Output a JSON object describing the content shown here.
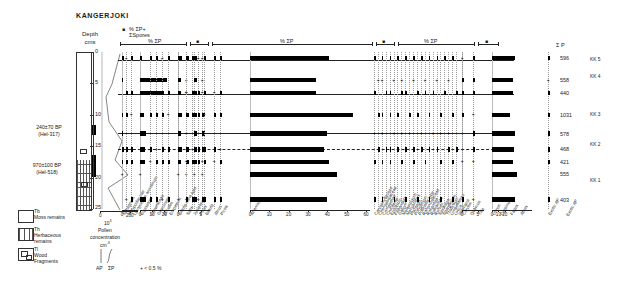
{
  "title": "KANGERJOKI",
  "header": {
    "spores_axis_label": "% ΣP+ ΣSpores",
    "sum_axis_label": "% ΣP",
    "depth_label_line1": "Depth",
    "depth_label_line2": "cms"
  },
  "dates": [
    {
      "value": "240±70 BP",
      "lab": "(Hel-317)"
    },
    {
      "value": "970±100 BP",
      "lab": "(Hel-518)"
    }
  ],
  "depth_axis": {
    "unit": "cms",
    "ticks": [
      0,
      5,
      10,
      15,
      20,
      25
    ],
    "min": 0,
    "max": 25
  },
  "concentration": {
    "title_line1": "Pollen",
    "title_line2": "concentration",
    "title_line3": "cm",
    "exponent": "-3",
    "multiplier": "10",
    "multiplier_exp": "3",
    "ticks": [
      0,
      200
    ],
    "ap_label": "AP",
    "sp_label": "ΣP",
    "values": [
      120,
      95,
      60,
      75,
      140,
      105,
      175,
      60,
      120
    ]
  },
  "footnote": "+ < 0.5 %",
  "legend": [
    {
      "code": "Tb",
      "name_line1": "Moss remains",
      "name_line2": ""
    },
    {
      "code": "Th",
      "name_line1": "Herbaceous",
      "name_line2": "remains"
    },
    {
      "code": "Tl",
      "name_line1": "Wood",
      "name_line2": "Fragments"
    }
  ],
  "sum_column": {
    "header": "Σ P",
    "values": [
      596,
      558,
      440,
      1031,
      578,
      468,
      421,
      555,
      403
    ]
  },
  "zones": [
    "KK 5",
    "KK 4",
    "KK 3",
    "KK 2",
    "KK 1"
  ],
  "exotic_label": "Exotic AP",
  "sample_depths": [
    1,
    4.5,
    6.5,
    10,
    13,
    15.5,
    17.5,
    19.5,
    23.5
  ],
  "chart_data": {
    "type": "bar",
    "orientation": "horizontal-stacked-columns",
    "xlabel": "% ΣP",
    "ylabel": "Depth (cms)",
    "y": [
      1,
      4.5,
      6.5,
      10,
      13,
      15.5,
      17.5,
      19.5,
      23.5
    ],
    "panels": [
      {
        "name": "panel-1",
        "axis_label": "% ΣP+ ΣSpores",
        "ticks": [
          0
        ],
        "xmax": 20,
        "taxa": [
          {
            "name": "Sphagnum",
            "values": [
              2,
              1,
              0,
              1.5,
              1,
              2,
              1,
              0.3,
              0
            ]
          }
        ]
      },
      {
        "name": "panel-2",
        "axis_label": "% ΣP",
        "ticks": [
          0,
          10,
          20
        ],
        "xmax": 28,
        "taxa": [
          {
            "name": "Cyperaceae",
            "values": [
              2,
              22,
              18,
              3.5,
              5,
              4,
              4,
              0.3,
              5
            ]
          }
        ]
      },
      {
        "name": "panel-3",
        "axis_label": "% ΣP",
        "ticks": [
          0,
          5
        ],
        "xmax": 7,
        "taxa": [
          {
            "name": "Gramineae",
            "values": [
              1.5,
              1.2,
              1.2,
              1.4,
              1.2,
              1.5,
              1.3,
              0.4,
              0.4
            ]
          },
          {
            "name": "Ericales",
            "values": [
              1.2,
              0.4,
              0.4,
              1.2,
              0.4,
              1.3,
              1.3,
              0.4,
              0.4
            ]
          },
          {
            "name": "Empetrum",
            "values": [
              1.2,
              1.1,
              1.1,
              1.2,
              1.1,
              1.2,
              1.1,
              0.4,
              1.2
            ]
          },
          {
            "name": "Betula nana type",
            "values": [
              0.4,
              0.4,
              0.4,
              1.1,
              1.1,
              1.1,
              0.4,
              0.4,
              1.1
            ]
          }
        ]
      },
      {
        "name": "panel-4",
        "axis_label": "% ΣP",
        "ticks": [
          0,
          10,
          20,
          30,
          40,
          50,
          60
        ],
        "xmax": 62,
        "taxa": [
          {
            "name": "Betula",
            "values": [
              41,
              34,
              34,
              53,
              40,
              38,
              41,
              45,
              40
            ]
          }
        ]
      },
      {
        "name": "panel-5",
        "axis_label": "% ΣP",
        "ticks": [
          0,
          5
        ],
        "xmax": 7,
        "taxa": [
          {
            "name": "Juniperus",
            "values": [
              0.4,
              1.2,
              1.2,
              1.3,
              0.4,
              0.4,
              0.4,
              0,
              1.2
            ]
          },
          {
            "name": "Pinus",
            "values": [
              1.2,
              1.3,
              1.2,
              0.4,
              1.2,
              1.2,
              0.4,
              0,
              0.4
            ]
          }
        ]
      },
      {
        "name": "panel-6",
        "axis_label": "% ΣP",
        "ticks": [
          0,
          10,
          20,
          30,
          40,
          50,
          60
        ],
        "xmax": 62,
        "taxa": [
          {
            "name": "Alnus",
            "values": [
              36,
              33,
              33,
              28,
              36,
              34,
              32,
              38,
              35
            ]
          }
        ]
      }
    ],
    "trace_taxa": [
      "Sphagnum",
      "Polypodiaceae",
      "Lycopodium annotinum",
      "Equisetum",
      "Cyperaceae",
      "Gramineae",
      "Ericales",
      "Empetrum",
      "Betula nana type",
      "Salix",
      "Juniperus",
      "Pinus",
      "Betula",
      "Alnus",
      "Picea",
      "Artemisia",
      "Caryophyllaceae",
      "Chenopodiaceae",
      "Compositae",
      "Cruciferae",
      "Epilobium",
      "Filipendula",
      "Galium",
      "Melampyrum",
      "Menyanthes",
      "Plantago",
      "Polygonum",
      "Potentilla type",
      "Ranunculaceae",
      "Rosaceae",
      "Rubiaceae",
      "Rumex",
      "Saxifraga",
      "Sparganium",
      "Thalictrum",
      "Umbelliferae",
      "Urtica",
      "Valeriana",
      "Corylus",
      "Quercus",
      "Tilia",
      "Ulmus",
      "Carpinus",
      "Fagus",
      "Abies",
      "Exotic AP"
    ]
  }
}
